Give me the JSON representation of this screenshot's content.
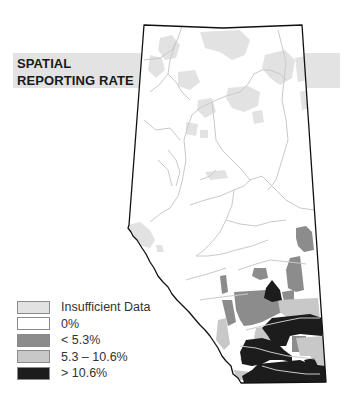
{
  "title": {
    "line1": "SPATIAL",
    "line2": "REPORTING RATE"
  },
  "colors": {
    "insufficient": "#e2e2e2",
    "zero": "#ffffff",
    "low": "#8c8c8c",
    "mid": "#c8c8c8",
    "high": "#1c1c1c",
    "rivers": "#c9c9c9",
    "border": "#111111",
    "band": "#e3e3e3"
  },
  "legend": {
    "items": [
      {
        "label": "Insufficient Data",
        "color": "#e2e2e2"
      },
      {
        "label": "0%",
        "color": "#ffffff"
      },
      {
        "label": "< 5.3%",
        "color": "#8c8c8c"
      },
      {
        "label": "5.3 – 10.6%",
        "color": "#c8c8c8"
      },
      {
        "label": "> 10.6%",
        "color": "#1c1c1c"
      }
    ]
  }
}
